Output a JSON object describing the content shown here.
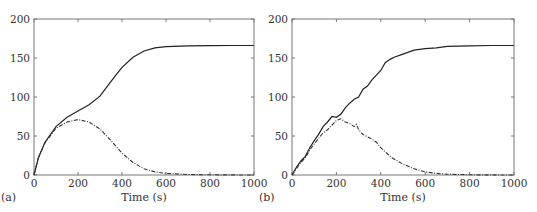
{
  "chart_data": [
    {
      "type": "line",
      "panel_label": "(a)",
      "title": "",
      "xlabel": "Time (s)",
      "ylabel": "",
      "xlim": [
        0,
        1000
      ],
      "ylim": [
        0,
        200
      ],
      "xticks": [
        0,
        200,
        400,
        600,
        800,
        1000
      ],
      "yticks": [
        0,
        50,
        100,
        150,
        200
      ],
      "grid": false,
      "legend": "none",
      "series": [
        {
          "name": "solid",
          "style": "solid",
          "x": [
            0,
            20,
            50,
            100,
            150,
            200,
            250,
            300,
            350,
            400,
            450,
            500,
            550,
            600,
            700,
            800,
            900,
            1000
          ],
          "y": [
            0,
            22,
            42,
            62,
            74,
            82,
            90,
            101,
            120,
            138,
            151,
            159,
            163,
            164.5,
            165.5,
            165.8,
            166,
            166
          ]
        },
        {
          "name": "dash-dot",
          "style": "dashdot",
          "x": [
            0,
            20,
            50,
            100,
            150,
            200,
            250,
            300,
            350,
            400,
            450,
            500,
            550,
            600,
            700,
            800,
            900,
            1000
          ],
          "y": [
            0,
            22,
            41,
            60,
            68,
            71,
            68,
            59,
            44,
            28,
            16,
            8,
            4,
            2,
            0.6,
            0.2,
            0.1,
            0
          ]
        }
      ]
    },
    {
      "type": "line",
      "panel_label": "(b)",
      "title": "",
      "xlabel": "Time (s)",
      "ylabel": "",
      "xlim": [
        0,
        1000
      ],
      "ylim": [
        0,
        200
      ],
      "xticks": [
        0,
        200,
        400,
        600,
        800,
        1000
      ],
      "yticks": [
        0,
        50,
        100,
        150,
        200
      ],
      "grid": false,
      "legend": "none",
      "series": [
        {
          "name": "solid",
          "style": "solid",
          "x": [
            0,
            20,
            40,
            60,
            80,
            100,
            120,
            140,
            160,
            180,
            200,
            220,
            240,
            260,
            280,
            300,
            320,
            340,
            360,
            380,
            400,
            420,
            440,
            460,
            500,
            550,
            600,
            650,
            700,
            800,
            900,
            1000
          ],
          "y": [
            0,
            10,
            18,
            24,
            35,
            44,
            52,
            62,
            68,
            75,
            74,
            78,
            86,
            92,
            97,
            100,
            110,
            114,
            122,
            128,
            134,
            144,
            148,
            151,
            155,
            160,
            162,
            163,
            165,
            165.5,
            166,
            166
          ]
        },
        {
          "name": "dash-dot",
          "style": "dashdot",
          "x": [
            0,
            20,
            40,
            60,
            80,
            100,
            120,
            140,
            160,
            180,
            200,
            220,
            240,
            260,
            280,
            290,
            300,
            320,
            340,
            360,
            380,
            400,
            450,
            500,
            550,
            600,
            650,
            700,
            800,
            900,
            1000
          ],
          "y": [
            0,
            8,
            16,
            22,
            32,
            40,
            47,
            54,
            58,
            64,
            70,
            72,
            68,
            66,
            62,
            65,
            58,
            52,
            49,
            46,
            42,
            35,
            22,
            14,
            8,
            4,
            2,
            1,
            0.3,
            0.1,
            0
          ]
        }
      ]
    }
  ]
}
